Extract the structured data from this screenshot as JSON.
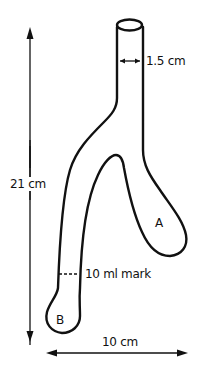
{
  "diagram": {
    "type": "Y-shaped glass tube (Thiele-style two-armed vessel)",
    "labels": {
      "diameter": "1.5 cm",
      "height": "21 cm",
      "width": "10 cm",
      "mark": "10 ml mark",
      "arm_a": "A",
      "arm_b": "B"
    },
    "colors": {
      "line": "#111111",
      "background": "#ffffff"
    }
  }
}
